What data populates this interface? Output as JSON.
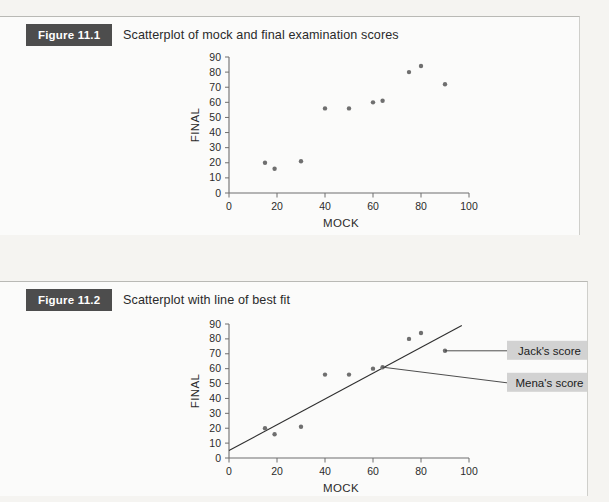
{
  "page": {
    "background_color": "#f3f2ef",
    "paper_color": "#fbfbfa"
  },
  "figures": [
    {
      "tag": "Figure 11.1",
      "title": "Scatterplot of mock and final examination scores"
    },
    {
      "tag": "Figure 11.2",
      "title": "Scatterplot with line of best fit"
    }
  ],
  "callouts": [
    {
      "id": "jack",
      "label": "Jack's score"
    },
    {
      "id": "mena",
      "label": "Mena's score"
    }
  ],
  "chart_data": [
    {
      "id": "figure-11-1",
      "type": "scatter",
      "title": "Scatterplot of mock and final examination scores",
      "xlabel": "MOCK",
      "ylabel": "FINAL",
      "xlim": [
        0,
        100
      ],
      "ylim": [
        0,
        90
      ],
      "xticks": [
        0,
        20,
        40,
        60,
        80,
        100
      ],
      "yticks": [
        0,
        10,
        20,
        30,
        40,
        50,
        60,
        70,
        80,
        90
      ],
      "grid": false,
      "legend": "none",
      "marker_color": "#6f6f6f",
      "points": [
        {
          "x": 15,
          "y": 20
        },
        {
          "x": 19,
          "y": 16
        },
        {
          "x": 30,
          "y": 21
        },
        {
          "x": 40,
          "y": 56
        },
        {
          "x": 50,
          "y": 56
        },
        {
          "x": 60,
          "y": 60
        },
        {
          "x": 64,
          "y": 61
        },
        {
          "x": 75,
          "y": 80
        },
        {
          "x": 80,
          "y": 84
        },
        {
          "x": 90,
          "y": 72
        }
      ]
    },
    {
      "id": "figure-11-2",
      "type": "scatter",
      "title": "Scatterplot with line of best fit",
      "xlabel": "MOCK",
      "ylabel": "FINAL",
      "xlim": [
        0,
        100
      ],
      "ylim": [
        0,
        90
      ],
      "xticks": [
        0,
        20,
        40,
        60,
        80,
        100
      ],
      "yticks": [
        0,
        10,
        20,
        30,
        40,
        50,
        60,
        70,
        80,
        90
      ],
      "grid": false,
      "legend": "none",
      "marker_color": "#6f6f6f",
      "points": [
        {
          "x": 15,
          "y": 20
        },
        {
          "x": 19,
          "y": 16
        },
        {
          "x": 30,
          "y": 21
        },
        {
          "x": 40,
          "y": 56
        },
        {
          "x": 50,
          "y": 56
        },
        {
          "x": 60,
          "y": 60
        },
        {
          "x": 64,
          "y": 61,
          "annotation": "Mena's score"
        },
        {
          "x": 75,
          "y": 80
        },
        {
          "x": 80,
          "y": 84
        },
        {
          "x": 90,
          "y": 72,
          "annotation": "Jack's score"
        }
      ],
      "line_of_best_fit": {
        "label": "line of best fit",
        "x_start": 0,
        "y_start": 5,
        "x_end": 97,
        "y_end": 89
      },
      "annotations": [
        {
          "text": "Jack's score",
          "points_to": {
            "x": 90,
            "y": 72
          }
        },
        {
          "text": "Mena's score",
          "points_to": {
            "x": 64,
            "y": 61
          }
        }
      ]
    }
  ]
}
